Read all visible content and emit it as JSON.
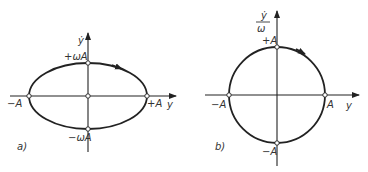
{
  "panel_a": {
    "tag": "a)",
    "y_axis_label": "ẏ",
    "x_axis_label": "y",
    "top_label": "+ωA",
    "bottom_label": "−ωA",
    "left_label": "−A",
    "right_label": "+A",
    "curve": "ellipse"
  },
  "panel_b": {
    "tag": "b)",
    "y_axis_label_num": "ẏ",
    "y_axis_label_den": "ω",
    "x_axis_label": "y",
    "top_label": "+A",
    "bottom_label": "−A",
    "left_label": "−A",
    "right_label": "A",
    "curve": "circle"
  }
}
